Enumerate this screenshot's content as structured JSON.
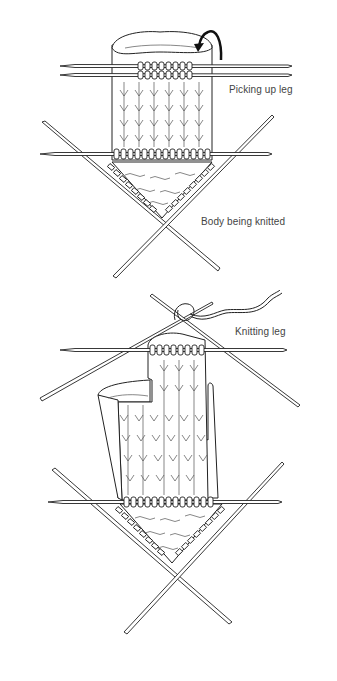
{
  "figures": [
    {
      "id": "picking-up-leg",
      "labels": {
        "step": "Picking up leg",
        "body": "Body being knitted"
      }
    },
    {
      "id": "knitting-leg",
      "labels": {
        "step": "Knitting leg"
      }
    }
  ],
  "colors": {
    "ink": "#222222",
    "label": "#444444",
    "background": "#ffffff"
  }
}
